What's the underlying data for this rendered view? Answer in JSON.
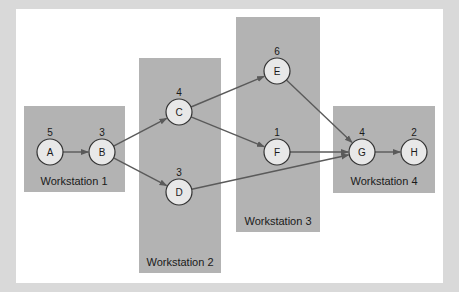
{
  "diagram": {
    "colors": {
      "background": "#d9d9d9",
      "panel": "#ffffff",
      "workstation_fill": "#b3b3b3",
      "node_fill": "#e8e8e8",
      "node_stroke": "#333333",
      "edge": "#5a5a5a"
    },
    "workstations": [
      {
        "id": "ws1",
        "label": "Workstation 1",
        "x": 24,
        "y": 106,
        "w": 101,
        "h": 86,
        "label_x": 74,
        "label_y": 185
      },
      {
        "id": "ws2",
        "label": "Workstation 2",
        "x": 139,
        "y": 58,
        "w": 82,
        "h": 215,
        "label_x": 180,
        "label_y": 266
      },
      {
        "id": "ws3",
        "label": "Workstation 3",
        "x": 236,
        "y": 17,
        "w": 84,
        "h": 215,
        "label_x": 278,
        "label_y": 225
      },
      {
        "id": "ws4",
        "label": "Workstation 4",
        "x": 333,
        "y": 106,
        "w": 102,
        "h": 87,
        "label_x": 384,
        "label_y": 185
      }
    ],
    "nodes": [
      {
        "id": "A",
        "label": "A",
        "time": "5",
        "cx": 50,
        "cy": 152
      },
      {
        "id": "B",
        "label": "B",
        "time": "3",
        "cx": 102,
        "cy": 152
      },
      {
        "id": "C",
        "label": "C",
        "time": "4",
        "cx": 179,
        "cy": 112
      },
      {
        "id": "D",
        "label": "D",
        "time": "3",
        "cx": 179,
        "cy": 192
      },
      {
        "id": "E",
        "label": "E",
        "time": "6",
        "cx": 277,
        "cy": 71
      },
      {
        "id": "F",
        "label": "F",
        "time": "1",
        "cx": 277,
        "cy": 152
      },
      {
        "id": "G",
        "label": "G",
        "time": "4",
        "cx": 362,
        "cy": 152
      },
      {
        "id": "H",
        "label": "H",
        "time": "2",
        "cx": 414,
        "cy": 152
      }
    ],
    "edges": [
      {
        "from": "A",
        "to": "B"
      },
      {
        "from": "B",
        "to": "C"
      },
      {
        "from": "B",
        "to": "D"
      },
      {
        "from": "C",
        "to": "E"
      },
      {
        "from": "C",
        "to": "F"
      },
      {
        "from": "D",
        "to": "G"
      },
      {
        "from": "E",
        "to": "G"
      },
      {
        "from": "F",
        "to": "G"
      },
      {
        "from": "G",
        "to": "H"
      }
    ]
  }
}
